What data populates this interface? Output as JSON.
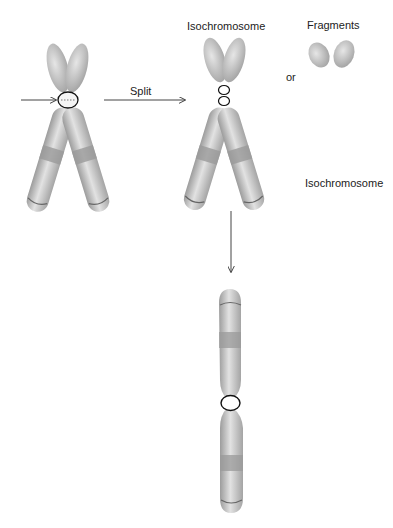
{
  "diagram": {
    "labels": {
      "split": "Split",
      "isochromosome_top": "Isochromosome",
      "fragments": "Fragments",
      "or": "or",
      "isochromosome_right": "Isochromosome"
    },
    "colors": {
      "chromatid": "#b4b4b4",
      "chromatid_light": "#dcdcdc",
      "band": "#9a9a9a",
      "outline": "#111111",
      "arrow": "#444444",
      "background": "#ffffff"
    }
  }
}
